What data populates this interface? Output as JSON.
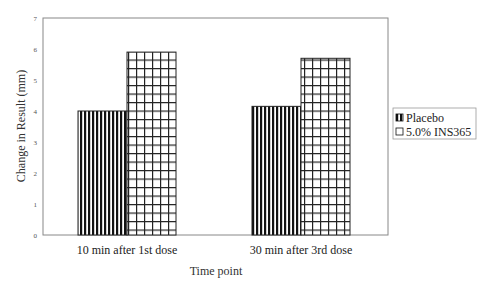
{
  "chart_data": {
    "type": "bar",
    "title": "",
    "xlabel": "Time point",
    "ylabel": "Change in Result (mm)",
    "ylim": [
      0,
      7
    ],
    "yticks": [
      0,
      1,
      2,
      3,
      4,
      5,
      6,
      7
    ],
    "categories": [
      "10 min after 1st dose",
      "30 min after 3rd dose"
    ],
    "series": [
      {
        "name": "Placebo",
        "pattern": "vertical-stripes",
        "values": [
          4.0,
          4.15
        ]
      },
      {
        "name": "5.0% INS365",
        "pattern": "grid-crosshatch",
        "values": [
          5.9,
          5.7
        ]
      }
    ],
    "grid": false,
    "legend": "right",
    "colors": {
      "ink": "#111111",
      "frame": "#888888",
      "background": "#ffffff"
    }
  }
}
